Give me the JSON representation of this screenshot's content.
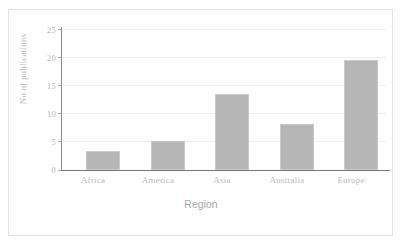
{
  "chart_data": {
    "type": "bar",
    "title": "",
    "subtitle": "",
    "xlabel": "Region",
    "ylabel": "No of publications",
    "categories": [
      "Africa",
      "America",
      "Asia",
      "Australia",
      "Europe"
    ],
    "values": [
      3.4,
      5.2,
      13.5,
      8.2,
      19.5
    ],
    "ylim": [
      0,
      25
    ],
    "yticks": [
      0,
      5,
      10,
      15,
      20,
      25
    ],
    "ytick_labels": [
      "0",
      "5",
      "10",
      "15",
      "20",
      "25"
    ],
    "grid": true,
    "grid_axis": "y",
    "legend": false,
    "legend_position": "none",
    "bar_color": "#b5b5b5",
    "axis_color": "#8e8e8e",
    "gridline_color": "#f1eeee",
    "text_color": "#b9b7b7",
    "background_color": "#fefefe",
    "frame_border_color": "#e2e2e2"
  }
}
